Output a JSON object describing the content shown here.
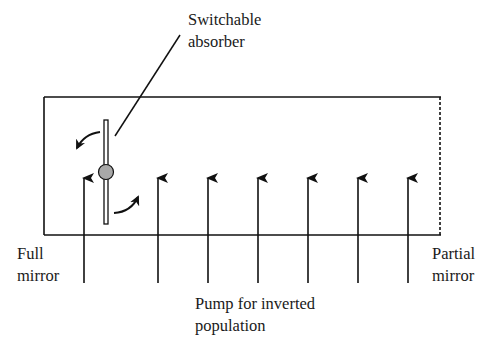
{
  "diagram": {
    "type": "laser cavity schematic (Q-switching)",
    "labels": {
      "absorber": [
        "Switchable",
        "absorber"
      ],
      "full_mirror": [
        "Full",
        "mirror"
      ],
      "partial_mirror": [
        "Partial",
        "mirror"
      ],
      "pump": [
        "Pump for inverted",
        "population"
      ]
    },
    "elements": {
      "cavity_box": {
        "left_edge": "full mirror (solid line)",
        "right_edge": "partial mirror (dotted line)"
      },
      "absorber": {
        "shape": "vertical bar with grey pivot circle",
        "rotation_arrows": 2
      },
      "pump_arrows": {
        "count": 7,
        "direction": "up"
      }
    },
    "colors": {
      "line": "#111111",
      "pivot_fill": "#a8a8a8",
      "background": "#ffffff"
    }
  }
}
